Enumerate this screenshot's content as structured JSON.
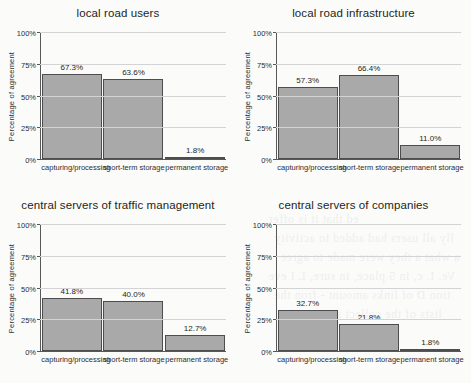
{
  "page": {
    "background_color": "#fbfbfa",
    "bleed_through_lines": [
      "ed that it is offer",
      "lly all users had added to activity",
      "a what a they were made to agree",
      "Ve. I. c, in 5 place, in sure, L I eve",
      "tion D of links amount - fron the",
      "lists of the collect same to the"
    ]
  },
  "chart_data": [
    {
      "type": "bar",
      "title": "local road users",
      "xlabel": "",
      "ylabel": "Percentage of agreement",
      "categories": [
        "capturing/processing",
        "short-term storage",
        "permanent storage"
      ],
      "values": [
        67.3,
        63.6,
        1.8
      ],
      "value_labels": [
        "67.3%",
        "63.6%",
        "1.8%"
      ],
      "ylim": [
        0,
        100
      ],
      "yticks": [
        0,
        25,
        50,
        75,
        100
      ],
      "ytick_labels": [
        "0%",
        "25%",
        "50%",
        "75%",
        "100%"
      ],
      "grid": true,
      "legend": "none",
      "bar_color": "#a9a9a9",
      "bar_edge_color": "#4d4d4f"
    },
    {
      "type": "bar",
      "title": "local road infrastructure",
      "xlabel": "",
      "ylabel": "Percentage of agreement",
      "categories": [
        "capturing/processing",
        "short-term storage",
        "permanent storage"
      ],
      "values": [
        57.3,
        66.4,
        11.0
      ],
      "value_labels": [
        "57.3%",
        "66.4%",
        "11.0%"
      ],
      "ylim": [
        0,
        100
      ],
      "yticks": [
        0,
        25,
        50,
        75,
        100
      ],
      "ytick_labels": [
        "0%",
        "25%",
        "50%",
        "75%",
        "100%"
      ],
      "grid": true,
      "legend": "none",
      "bar_color": "#a9a9a9",
      "bar_edge_color": "#4d4d4f"
    },
    {
      "type": "bar",
      "title": "central servers of traffic management",
      "xlabel": "",
      "ylabel": "Percentage of agreement",
      "categories": [
        "capturing/processing",
        "short-term storage",
        "permanent storage"
      ],
      "values": [
        41.8,
        40.0,
        12.7
      ],
      "value_labels": [
        "41.8%",
        "40.0%",
        "12.7%"
      ],
      "ylim": [
        0,
        100
      ],
      "yticks": [
        0,
        25,
        50,
        75,
        100
      ],
      "ytick_labels": [
        "0%",
        "25%",
        "50%",
        "75%",
        "100%"
      ],
      "grid": true,
      "legend": "none",
      "bar_color": "#a9a9a9",
      "bar_edge_color": "#4d4d4f"
    },
    {
      "type": "bar",
      "title": "central servers of companies",
      "xlabel": "",
      "ylabel": "Percentage of agreement",
      "categories": [
        "capturing/processing",
        "short-term storage",
        "permanent storage"
      ],
      "values": [
        32.7,
        21.8,
        1.8
      ],
      "value_labels": [
        "32.7%",
        "21.8%",
        "1.8%"
      ],
      "ylim": [
        0,
        100
      ],
      "yticks": [
        0,
        25,
        50,
        75,
        100
      ],
      "ytick_labels": [
        "0%",
        "25%",
        "50%",
        "75%",
        "100%"
      ],
      "grid": true,
      "legend": "none",
      "bar_color": "#a9a9a9",
      "bar_edge_color": "#4d4d4f"
    }
  ]
}
